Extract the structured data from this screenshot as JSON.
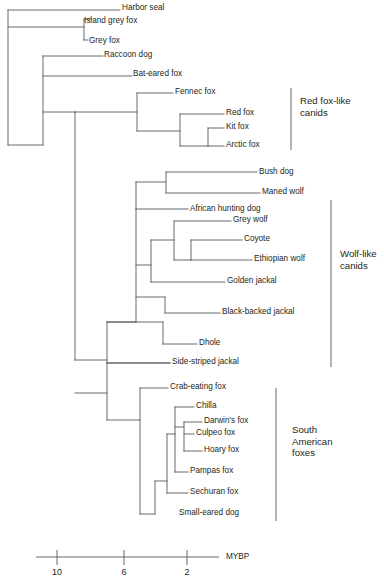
{
  "diagram": {
    "type": "phylogenetic-tree",
    "title": "",
    "line_color": "#58595b",
    "text_color": "#231f20",
    "tips": [
      {
        "name": "Harbor seal",
        "x": 122,
        "y": 8
      },
      {
        "name": "Island grey fox",
        "x": 84,
        "y": 21
      },
      {
        "name": "Grey fox",
        "x": 89,
        "y": 41
      },
      {
        "name": "Raccoon dog",
        "x": 104,
        "y": 55
      },
      {
        "name": "Bat-eared fox",
        "x": 133,
        "y": 74
      },
      {
        "name": "Fennec fox",
        "x": 175,
        "y": 92
      },
      {
        "name": "Red fox",
        "x": 226,
        "y": 113
      },
      {
        "name": "Kit fox",
        "x": 226,
        "y": 127
      },
      {
        "name": "Arctic fox",
        "x": 226,
        "y": 145
      },
      {
        "name": "Bush dog",
        "x": 259,
        "y": 172
      },
      {
        "name": "Maned wolf",
        "x": 262,
        "y": 192
      },
      {
        "name": "African hunting dog",
        "x": 190,
        "y": 209
      },
      {
        "name": "Grey wolf",
        "x": 233,
        "y": 220
      },
      {
        "name": "Coyote",
        "x": 244,
        "y": 239
      },
      {
        "name": "Ethiopian wolf",
        "x": 254,
        "y": 259
      },
      {
        "name": "Golden jackal",
        "x": 227,
        "y": 281
      },
      {
        "name": "Black-backed jackal",
        "x": 222,
        "y": 312
      },
      {
        "name": "Dhole",
        "x": 199,
        "y": 343
      },
      {
        "name": "Side-striped jackal",
        "x": 172,
        "y": 362
      },
      {
        "name": "Crab-eating fox",
        "x": 170,
        "y": 387
      },
      {
        "name": "Chilla",
        "x": 196,
        "y": 406
      },
      {
        "name": "Darwin's fox",
        "x": 204,
        "y": 421
      },
      {
        "name": "Culpeo fox",
        "x": 196,
        "y": 433
      },
      {
        "name": "Hoary fox",
        "x": 204,
        "y": 450
      },
      {
        "name": "Pampas fox",
        "x": 190,
        "y": 471
      },
      {
        "name": "Sechuran fox",
        "x": 190,
        "y": 492
      },
      {
        "name": "Small-eared dog",
        "x": 179,
        "y": 513
      }
    ],
    "branches": [
      {
        "d": "M 8 10 L 8 145"
      },
      {
        "d": "M 8 10 L 120 10"
      },
      {
        "d": "M 8 27 L 84 27"
      },
      {
        "d": "M 84 19 L 84 40"
      },
      {
        "d": "M 84 19 L 92 19"
      },
      {
        "d": "M 84 40 L 88 40"
      },
      {
        "d": "M 8 145 L 43 145"
      },
      {
        "d": "M 43 56 L 43 145"
      },
      {
        "d": "M 43 56 L 103 56"
      },
      {
        "d": "M 43 76 L 132 76"
      },
      {
        "d": "M 43 112 L 75 112"
      },
      {
        "d": "M 75 112 L 75 360"
      },
      {
        "d": "M 75 112 L 137 112"
      },
      {
        "d": "M 137 93 L 137 131"
      },
      {
        "d": "M 137 93 L 173 93"
      },
      {
        "d": "M 137 131 L 180 131"
      },
      {
        "d": "M 180 114 L 180 146"
      },
      {
        "d": "M 180 114 L 224 114"
      },
      {
        "d": "M 180 146 L 208 146"
      },
      {
        "d": "M 208 128 L 208 146"
      },
      {
        "d": "M 208 128 L 224 128"
      },
      {
        "d": "M 208 146 L 224 146"
      },
      {
        "d": "M 75 360 L 107 360"
      },
      {
        "d": "M 107 322 L 107 363"
      },
      {
        "d": "M 107 363 L 170 363"
      },
      {
        "d": "M 107 322 L 136 322"
      },
      {
        "d": "M 136 209 L 136 322"
      },
      {
        "d": "M 136 182 L 136 209"
      },
      {
        "d": "M 136 182 L 166 182"
      },
      {
        "d": "M 166 172 L 166 193"
      },
      {
        "d": "M 166 172 L 257 172"
      },
      {
        "d": "M 166 193 L 260 193"
      },
      {
        "d": "M 136 209 L 188 209"
      },
      {
        "d": "M 136 265 L 151 265"
      },
      {
        "d": "M 151 240 L 151 282"
      },
      {
        "d": "M 151 240 L 174 240"
      },
      {
        "d": "M 174 221 L 174 260"
      },
      {
        "d": "M 174 221 L 231 221"
      },
      {
        "d": "M 174 260 L 191 260"
      },
      {
        "d": "M 191 240 L 191 260"
      },
      {
        "d": "M 191 240 L 242 240"
      },
      {
        "d": "M 191 260 L 252 260"
      },
      {
        "d": "M 151 282 L 225 282"
      },
      {
        "d": "M 136 297 L 165 297"
      },
      {
        "d": "M 165 297 L 165 313"
      },
      {
        "d": "M 165 313 L 220 313"
      },
      {
        "d": "M 107 322 L 163 322"
      },
      {
        "d": "M 163 322 L 163 344"
      },
      {
        "d": "M 163 344 L 197 344"
      },
      {
        "d": "M 107 363 L 170 363"
      },
      {
        "d": "M 107 420 L 140 420"
      },
      {
        "d": "M 140 388 L 140 514"
      },
      {
        "d": "M 140 388 L 168 388"
      },
      {
        "d": "M 140 514 L 155 514"
      },
      {
        "d": "M 155 481 L 155 514"
      },
      {
        "d": "M 155 481 L 167 481"
      },
      {
        "d": "M 167 434 L 167 493"
      },
      {
        "d": "M 167 493 L 188 493"
      },
      {
        "d": "M 167 434 L 175 434"
      },
      {
        "d": "M 175 407 L 175 472"
      },
      {
        "d": "M 175 407 L 194 407"
      },
      {
        "d": "M 175 472 L 188 472"
      },
      {
        "d": "M 175 427 L 184 427"
      },
      {
        "d": "M 184 422 L 184 451"
      },
      {
        "d": "M 184 422 L 202 422"
      },
      {
        "d": "M 184 434 L 194 434"
      },
      {
        "d": "M 184 451 L 202 451"
      },
      {
        "d": "M 75 393 L 107 393"
      },
      {
        "d": "M 107 363 L 107 420"
      }
    ],
    "group_brackets": [
      {
        "name": "red-fox-like-canids",
        "label": "Red fox-like\ncanids",
        "x": 291,
        "y1": 88,
        "y2": 150,
        "label_x": 300,
        "label_y": 95
      },
      {
        "name": "wolf-like-canids",
        "label": "Wolf-like\ncanids",
        "x": 331,
        "y1": 200,
        "y2": 367,
        "label_x": 340,
        "label_y": 248
      },
      {
        "name": "south-american-foxes",
        "label": "South\nAmerican\nfoxes",
        "x": 276,
        "y1": 388,
        "y2": 521,
        "label_x": 292,
        "label_y": 424
      }
    ],
    "scale_axis": {
      "label": "MYBP",
      "label_x": 226,
      "label_y": 552,
      "line_x1": 36,
      "line_x2": 219,
      "line_y": 557,
      "ticks": [
        {
          "value": "10",
          "x": 57
        },
        {
          "value": "6",
          "x": 124
        },
        {
          "value": "2",
          "x": 187
        }
      ],
      "tick_y_top": 550,
      "tick_y_bottom": 565,
      "tick_label_y": 567
    }
  }
}
